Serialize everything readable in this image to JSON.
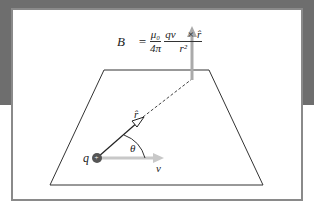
{
  "figure": {
    "formula": {
      "lhs": "B⃗",
      "equals": "=",
      "frac1_num": "μ₀",
      "frac1_den": "4π",
      "frac2_num": "qv⃗ × r̂",
      "frac2_den": "r²"
    },
    "labels": {
      "charge": "q",
      "charge_sign": "+",
      "unit_r": "r̂",
      "angle": "θ",
      "velocity": "v⃗"
    },
    "colors": {
      "background_band": "#6e6e6e",
      "panel_border": "#8a8a8a",
      "arrow_gray": "#b0b0b0",
      "line": "#333333",
      "charge": "#555555"
    }
  }
}
